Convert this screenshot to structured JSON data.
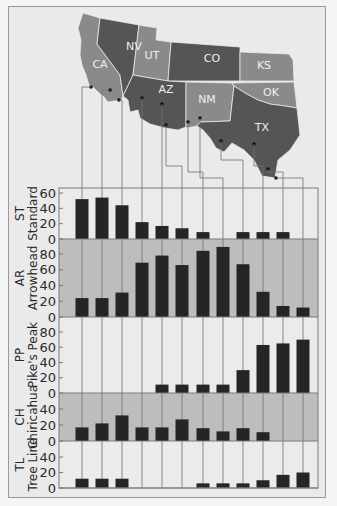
{
  "chart_data": {
    "type": "bar",
    "title": "",
    "layout": "stacked small-multiple panels with map of southwestern US states above; connector lines link map sample sites to bar columns",
    "map": {
      "states": [
        {
          "abbr": "CA",
          "shade": "#8a8a8a"
        },
        {
          "abbr": "NV",
          "shade": "#555555"
        },
        {
          "abbr": "UT",
          "shade": "#8a8a8a"
        },
        {
          "abbr": "CO",
          "shade": "#555555"
        },
        {
          "abbr": "KS",
          "shade": "#8a8a8a"
        },
        {
          "abbr": "AZ",
          "shade": "#555555"
        },
        {
          "abbr": "NM",
          "shade": "#8a8a8a"
        },
        {
          "abbr": "OK",
          "shade": "#8a8a8a"
        },
        {
          "abbr": "TX",
          "shade": "#555555"
        }
      ]
    },
    "columns": 12,
    "series": [
      {
        "code": "ST",
        "name": "Standard",
        "ylim": [
          0,
          60
        ],
        "ticks": [
          0,
          20,
          40,
          60
        ],
        "background": "#ebebeb",
        "values": [
          52,
          54,
          44,
          22,
          17,
          14,
          9,
          0,
          9,
          9,
          9,
          0
        ]
      },
      {
        "code": "AR",
        "name": "Arrowhead",
        "ylim": [
          0,
          90
        ],
        "ticks": [
          0,
          20,
          40,
          60,
          80
        ],
        "background": "#bdbdbd",
        "values": [
          24,
          24,
          31,
          69,
          78,
          66,
          84,
          89,
          67,
          32,
          14,
          12
        ]
      },
      {
        "code": "PP",
        "name": "Pike's Peak",
        "ylim": [
          0,
          90
        ],
        "ticks": [
          0,
          20,
          40,
          60,
          80
        ],
        "background": "#ebebeb",
        "values": [
          0,
          0,
          0,
          0,
          11,
          11,
          11,
          11,
          30,
          63,
          65,
          70
        ]
      },
      {
        "code": "CH",
        "name": "Chiricahua",
        "ylim": [
          0,
          55
        ],
        "ticks": [
          0,
          20,
          40
        ],
        "background": "#bdbdbd",
        "values": [
          17,
          22,
          32,
          17,
          17,
          27,
          16,
          12,
          16,
          11,
          0,
          0
        ]
      },
      {
        "code": "TL",
        "name": "Tree Line",
        "ylim": [
          0,
          55
        ],
        "ticks": [
          0,
          20,
          40
        ],
        "background": "#ebebeb",
        "values": [
          12,
          12,
          12,
          0,
          0,
          0,
          6,
          6,
          6,
          10,
          17,
          20
        ]
      }
    ],
    "xlabel": "",
    "grid": false,
    "legend": "none"
  },
  "colors": {
    "bar": "#252525",
    "axis": "#7a7a7a",
    "connector": "#6e6e6e",
    "dark_state": "#555555",
    "light_state": "#8a8a8a"
  }
}
